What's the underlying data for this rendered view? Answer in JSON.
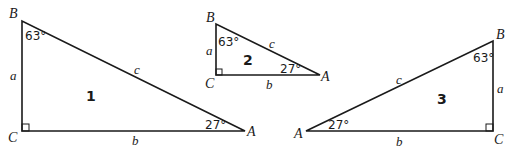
{
  "diagram": {
    "type": "similar right triangles",
    "triangles": [
      {
        "number": "1",
        "vertices": {
          "B": "B",
          "C": "C",
          "A": "A"
        },
        "sides": {
          "a": "a",
          "b": "b",
          "c": "c"
        },
        "angles": {
          "B": "63°",
          "A": "27°"
        },
        "right_angle_at": "C"
      },
      {
        "number": "2",
        "vertices": {
          "B": "B",
          "C": "C",
          "A": "A"
        },
        "sides": {
          "a": "a",
          "b": "b",
          "c": "c"
        },
        "angles": {
          "B": "63°",
          "A": "27°"
        },
        "right_angle_at": "C"
      },
      {
        "number": "3",
        "vertices": {
          "B": "B",
          "C": "C",
          "A": "A"
        },
        "sides": {
          "a": "a",
          "b": "b",
          "c": "c"
        },
        "angles": {
          "B": "63°",
          "A": "27°"
        },
        "right_angle_at": "C"
      }
    ],
    "colors": {
      "stroke": "#1a1a1a",
      "background": "#ffffff"
    }
  }
}
